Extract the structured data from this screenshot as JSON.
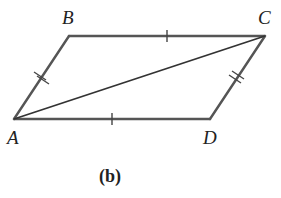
{
  "figure": {
    "caption": "(b)",
    "vertices": {
      "A": {
        "label": "A",
        "x": 14,
        "y": 119
      },
      "B": {
        "label": "B",
        "x": 69,
        "y": 36
      },
      "C": {
        "label": "C",
        "x": 265,
        "y": 36
      },
      "D": {
        "label": "D",
        "x": 210,
        "y": 119
      }
    },
    "segments": [
      {
        "from": "A",
        "to": "B",
        "ticks": 2
      },
      {
        "from": "B",
        "to": "C",
        "ticks": 1
      },
      {
        "from": "C",
        "to": "D",
        "ticks": 2
      },
      {
        "from": "D",
        "to": "A",
        "ticks": 1
      },
      {
        "from": "A",
        "to": "C",
        "ticks": 0,
        "type": "diagonal"
      }
    ],
    "colors": {
      "edge": "#555555",
      "text": "#222222"
    }
  }
}
